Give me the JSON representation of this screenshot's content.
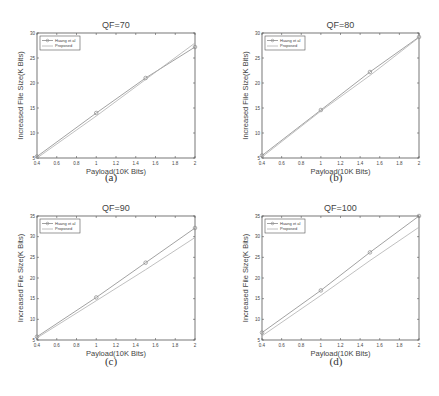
{
  "chart_data": [
    {
      "id": "a",
      "type": "line",
      "title": "QF=70",
      "xlabel": "Payload(10K Bits)",
      "ylabel": "Increased File Size(K Bits)",
      "xlim": [
        0.4,
        2
      ],
      "ylim": [
        5,
        30
      ],
      "xticks": [
        0.4,
        0.6,
        0.8,
        1,
        1.2,
        1.4,
        1.6,
        1.8,
        2
      ],
      "yticks": [
        5,
        10,
        15,
        20,
        25,
        30
      ],
      "legend_position": "upper left",
      "x": [
        0.4,
        1,
        1.5,
        2
      ],
      "series": [
        {
          "name": "Huang et al",
          "marker": "circle",
          "values": [
            5.3,
            14,
            21,
            27.2
          ]
        },
        {
          "name": "Proposed",
          "marker": "none",
          "values": [
            5,
            13.4,
            20.7,
            28
          ]
        }
      ],
      "caption": "(a)"
    },
    {
      "id": "b",
      "type": "line",
      "title": "QF=80",
      "xlabel": "Payload(10K Bits)",
      "ylabel": "Increased File Size(K Bits)",
      "xlim": [
        0.4,
        2
      ],
      "ylim": [
        5,
        30
      ],
      "xticks": [
        0.4,
        0.6,
        0.8,
        1,
        1.2,
        1.4,
        1.6,
        1.8,
        2
      ],
      "yticks": [
        5,
        10,
        15,
        20,
        25,
        30
      ],
      "legend_position": "upper left",
      "x": [
        0.4,
        1,
        1.5,
        2
      ],
      "series": [
        {
          "name": "Huang et al",
          "marker": "circle",
          "values": [
            5.5,
            14.6,
            22.2,
            29.2
          ]
        },
        {
          "name": "Proposed",
          "marker": "none",
          "values": [
            5.2,
            14.4,
            21.5,
            29.1
          ]
        }
      ],
      "caption": "(b)"
    },
    {
      "id": "c",
      "type": "line",
      "title": "QF=90",
      "xlabel": "Payload(10K Bits)",
      "ylabel": "Increased File Size(K Bits)",
      "xlim": [
        0.4,
        2
      ],
      "ylim": [
        5,
        35
      ],
      "xticks": [
        0.4,
        0.6,
        0.8,
        1,
        1.2,
        1.4,
        1.6,
        1.8,
        2
      ],
      "yticks": [
        5,
        10,
        15,
        20,
        25,
        30,
        35
      ],
      "legend_position": "upper left",
      "x": [
        0.4,
        1,
        1.5,
        2
      ],
      "series": [
        {
          "name": "Huang et al",
          "marker": "circle",
          "values": [
            5.8,
            15.3,
            23.7,
            32.1
          ]
        },
        {
          "name": "Proposed",
          "marker": "none",
          "values": [
            5.5,
            14.5,
            22,
            29.8
          ]
        }
      ],
      "caption": "(c)"
    },
    {
      "id": "d",
      "type": "line",
      "title": "QF=100",
      "xlabel": "Payload(10K Bits)",
      "ylabel": "Increased File Size(K Bits)",
      "xlim": [
        0.4,
        2
      ],
      "ylim": [
        5,
        35
      ],
      "xticks": [
        0.4,
        0.6,
        0.8,
        1,
        1.2,
        1.4,
        1.6,
        1.8,
        2
      ],
      "yticks": [
        5,
        10,
        15,
        20,
        25,
        30,
        35
      ],
      "legend_position": "upper left",
      "x": [
        0.4,
        1,
        1.5,
        2
      ],
      "series": [
        {
          "name": "Huang et al",
          "marker": "circle",
          "values": [
            6.8,
            17,
            26.2,
            35
          ]
        },
        {
          "name": "Proposed",
          "marker": "none",
          "values": [
            6,
            15.8,
            24.2,
            32.3
          ]
        }
      ],
      "caption": "(d)"
    }
  ],
  "colors": {
    "axis": "#555555",
    "huang_line": "#8a8a8a",
    "proposed_line": "#b0b0b0",
    "text": "#444444"
  }
}
